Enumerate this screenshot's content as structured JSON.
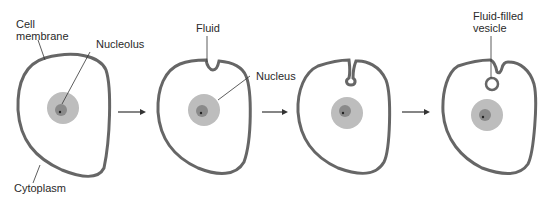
{
  "diagram": {
    "stages": [
      {
        "id": 1,
        "labels": [
          "Cell membrane",
          "Nucleolus",
          "Cytoplasm"
        ]
      },
      {
        "id": 2,
        "labels": [
          "Fluid",
          "Nucleus"
        ]
      },
      {
        "id": 3,
        "labels": []
      },
      {
        "id": 4,
        "labels": [
          "Fluid-filled vesicle"
        ]
      }
    ],
    "labels": {
      "cell_membrane_1": "Cell",
      "cell_membrane_2": "membrane",
      "nucleolus": "Nucleolus",
      "cytoplasm": "Cytoplasm",
      "fluid": "Fluid",
      "nucleus": "Nucleus",
      "vesicle_1": "Fluid-filled",
      "vesicle_2": "vesicle"
    },
    "colors": {
      "membrane": "#6b6b6b",
      "nucleus": "#b8b8b8",
      "nucleolus": "#858585",
      "line": "#333333"
    }
  }
}
